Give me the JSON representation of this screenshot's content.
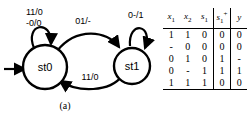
{
  "figure": {
    "panel_a": {
      "caption": "(a)",
      "states": [
        {
          "id": "st0",
          "label": "st0"
        },
        {
          "id": "st1",
          "label": "st1"
        }
      ],
      "initial_state": "st0",
      "transitions": [
        {
          "from": "st0",
          "to": "st0",
          "label_line1": "11/0",
          "label_line2": "-0/0",
          "kind": "self-loop"
        },
        {
          "from": "st0",
          "to": "st1",
          "label": "01/-",
          "kind": "arc-top"
        },
        {
          "from": "st1",
          "to": "st0",
          "label": "11/0",
          "kind": "arc-bottom"
        },
        {
          "from": "st1",
          "to": "st1",
          "label": "0-/1",
          "kind": "self-loop"
        }
      ]
    },
    "panel_b": {
      "caption": "(b)",
      "table": {
        "headers": [
          {
            "base": "x",
            "sub": "1",
            "sup": ""
          },
          {
            "base": "x",
            "sub": "2",
            "sup": ""
          },
          {
            "base": "s",
            "sub": "1",
            "sup": ""
          },
          {
            "base": "s",
            "sub": "1",
            "sup": "+"
          },
          {
            "base": "y",
            "sub": "",
            "sup": ""
          }
        ],
        "rows": [
          [
            "1",
            "1",
            "0",
            "0",
            "0"
          ],
          [
            "-",
            "0",
            "0",
            "0",
            "0"
          ],
          [
            "0",
            "1",
            "0",
            "1",
            "-"
          ],
          [
            "0",
            "-",
            "1",
            "1",
            "1"
          ],
          [
            "1",
            "1",
            "1",
            "0",
            "0"
          ]
        ]
      }
    }
  },
  "colors": {
    "ink": "#000000",
    "paper": "#ffffff"
  }
}
